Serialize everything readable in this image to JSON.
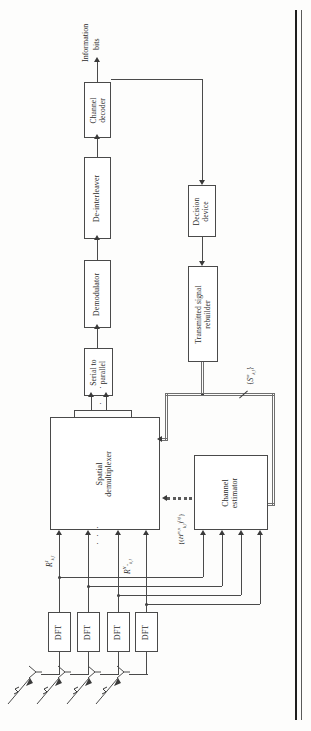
{
  "figure": {
    "kind": "block-diagram",
    "orientation": "rotated-90-ccw",
    "blocks": [
      {
        "id": "channel-decoder",
        "label_line1": "Channel",
        "label_line2": "decoder"
      },
      {
        "id": "de-interleaver",
        "label_line1": "De-interleaver",
        "label_line2": ""
      },
      {
        "id": "demodulator",
        "label_line1": "Demodulator",
        "label_line2": ""
      },
      {
        "id": "serial-to-parallel",
        "label_line1": "Serial to",
        "label_line2": "parallel"
      },
      {
        "id": "spatial-demultiplexer",
        "label_line1": "Spatial",
        "label_line2": "demultiplexer"
      },
      {
        "id": "decision-device",
        "label_line1": "Decision",
        "label_line2": "device"
      },
      {
        "id": "transmitted-signal-rebuilder",
        "label_line1": "Transmitted signal",
        "label_line2": "rebuilder"
      },
      {
        "id": "channel-estimator",
        "label_line1": "Channel",
        "label_line2": "estimator"
      },
      {
        "id": "dft-1",
        "label_line1": "DFT",
        "label_line2": ""
      },
      {
        "id": "dft-2",
        "label_line1": "DFT",
        "label_line2": ""
      },
      {
        "id": "dft-3",
        "label_line1": "DFT",
        "label_line2": ""
      },
      {
        "id": "dft-4",
        "label_line1": "DFT",
        "label_line2": ""
      }
    ],
    "annotations": {
      "output_label_line1": "Information",
      "output_label_line2": "bits",
      "signal_first": {
        "base": "R",
        "sup": "1",
        "sub": "k,l"
      },
      "signal_last": {
        "base": "R",
        "sup": "N",
        "sup2": "Tx",
        "sub": "k,l"
      },
      "channel_estimate": {
        "text": "{(H",
        "sup_mn": "m,n",
        "sub_kl": "k,l",
        "close": ")",
        "iter": "(q)",
        "tail": "}"
      },
      "rebuilt_symbols": {
        "open": "{",
        "base": "S",
        "sup": "m",
        "sub": "k,l",
        "close": "}"
      },
      "ellipsis_glyph": "· · ·"
    },
    "colors": {
      "ink": "#2b2b2b",
      "line": "#4a4a4a",
      "bus": "#6f6f6f",
      "page_rule": "#1e1e1e",
      "background": "#fdfdfc"
    }
  }
}
